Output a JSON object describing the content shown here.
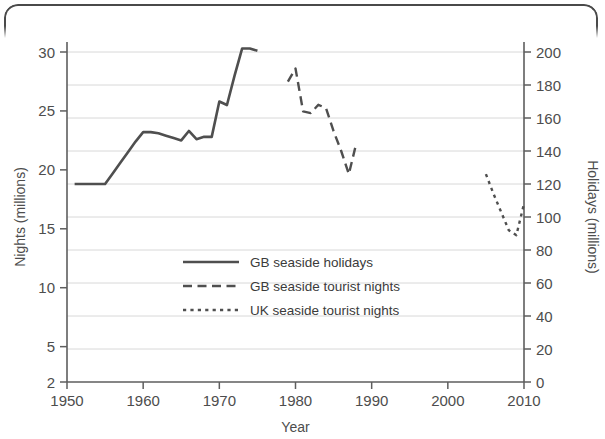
{
  "chart_data": {
    "type": "line",
    "title": "",
    "xlabel": "Year",
    "ylabel": "Nights (millions)",
    "y2label": "Holidays (millions)",
    "xlim": [
      1950,
      2010
    ],
    "ylim": [
      2,
      30
    ],
    "y2lim": [
      0,
      200
    ],
    "grid": true,
    "legend_position": "center",
    "xticks": [
      1950,
      1960,
      1970,
      1980,
      1990,
      2000,
      2010
    ],
    "xtick_labels": [
      "1950",
      "1960",
      "1970",
      "1980",
      "1990",
      "2000",
      "2010"
    ],
    "yticks": [
      2,
      5,
      10,
      15,
      20,
      25,
      30
    ],
    "ytick_labels": [
      "2",
      "5",
      "10",
      "15",
      "20",
      "25",
      "30"
    ],
    "y2ticks": [
      0,
      20,
      40,
      60,
      80,
      100,
      120,
      140,
      160,
      180,
      200
    ],
    "y2tick_labels": [
      "0",
      "20",
      "40",
      "60",
      "80",
      "100",
      "120",
      "140",
      "160",
      "180",
      "200"
    ],
    "series": [
      {
        "name": "GB seaside holidays",
        "style": "solid",
        "axis": "left",
        "color": "#4f4f4f",
        "x": [
          1951,
          1955,
          1956,
          1957,
          1958,
          1959,
          1960,
          1961,
          1962,
          1963,
          1964,
          1965,
          1966,
          1967,
          1968,
          1969,
          1970,
          1971,
          1972,
          1973,
          1974,
          1975
        ],
        "y": [
          18.8,
          18.8,
          19.7,
          20.6,
          21.5,
          22.4,
          23.2,
          23.2,
          23.1,
          22.9,
          22.7,
          22.5,
          23.3,
          22.6,
          22.8,
          22.8,
          25.8,
          25.5,
          28.0,
          30.3,
          30.3,
          30.1
        ]
      },
      {
        "name": "GB seaside tourist nights",
        "style": "dashed",
        "axis": "right",
        "color": "#4f4f4f",
        "x": [
          1979,
          1980,
          1981,
          1982,
          1983,
          1984,
          1985,
          1986,
          1987,
          1988
        ],
        "y": [
          182,
          190,
          164,
          163,
          168,
          166,
          152,
          140,
          126,
          145
        ]
      },
      {
        "name": "UK seaside tourist nights",
        "style": "dotted",
        "axis": "right",
        "color": "#4f4f4f",
        "x": [
          2005,
          2006,
          2007,
          2008,
          2009,
          2010
        ],
        "y": [
          126,
          114,
          103,
          92,
          89,
          108
        ]
      }
    ]
  },
  "axes": {
    "x_title": "Year",
    "y_left_title": "Nights (millions)",
    "y_right_title": "Holidays (millions)"
  },
  "legend": {
    "items": [
      {
        "label": "GB seaside holidays",
        "style": "solid"
      },
      {
        "label": "GB seaside tourist nights",
        "style": "dashed"
      },
      {
        "label": "UK seaside tourist nights",
        "style": "dotted"
      }
    ]
  },
  "colors": {
    "line": "#4f4f4f",
    "grid": "#d8d8d8",
    "axis": "#5e5e5e",
    "text": "#4d4d4d",
    "frame": "#4a4a4a",
    "background": "#ffffff"
  }
}
